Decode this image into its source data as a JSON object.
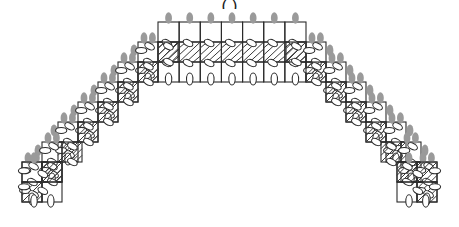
{
  "figure": {
    "title_fragment": "( )",
    "type": "stepped-masonry-arch-diagram",
    "background_color": "#ffffff",
    "line_color": "#2b2b2b",
    "hatch_color": "#3a3a3a",
    "joint_fill": "#ffffff",
    "load_marker_color": "#9a9a9a",
    "symmetry": "bilateral-vertical",
    "canvas": {
      "width": 459,
      "height": 227
    }
  },
  "geometry": {
    "cell_size": 20,
    "crown": {
      "left_x": 158,
      "right_x": 306,
      "top_y": 22,
      "rows": 3,
      "columns": 7,
      "row_tops": [
        22,
        42,
        62
      ],
      "soffit_y": 82
    },
    "steps_per_side": 7,
    "step_dx": 20,
    "step_dy": 20,
    "left_springing": {
      "x": 22,
      "y": 162,
      "width": 40,
      "height": 40
    },
    "right_springing": {
      "x": 397,
      "y": 162,
      "width": 40,
      "height": 40
    }
  },
  "elements": {
    "block_label": "masonry-block",
    "hatched_block_label": "hatched-block",
    "joint_label": "joint-marker",
    "load_marker_label": "load-marker",
    "crown_label": "arch-crown",
    "left_haunch_label": "left-haunch",
    "right_haunch_label": "right-haunch"
  },
  "chart_data": {
    "type": "diagram",
    "title": "",
    "crown_columns": 7,
    "crown_rows": 3,
    "steps_per_side": 7,
    "total_load_markers_top": 7,
    "load_markers_per_side": 14,
    "step_profile_left": [
      {
        "step": 1,
        "x": 138,
        "y": 42
      },
      {
        "step": 2,
        "x": 118,
        "y": 62
      },
      {
        "step": 3,
        "x": 98,
        "y": 82
      },
      {
        "step": 4,
        "x": 78,
        "y": 102
      },
      {
        "step": 5,
        "x": 58,
        "y": 122
      },
      {
        "step": 6,
        "x": 42,
        "y": 142
      },
      {
        "step": 7,
        "x": 22,
        "y": 162
      }
    ],
    "step_profile_right": [
      {
        "step": 1,
        "x": 306,
        "y": 42
      },
      {
        "step": 2,
        "x": 326,
        "y": 62
      },
      {
        "step": 3,
        "x": 346,
        "y": 82
      },
      {
        "step": 4,
        "x": 366,
        "y": 102
      },
      {
        "step": 5,
        "x": 386,
        "y": 122
      },
      {
        "step": 6,
        "x": 401,
        "y": 142
      },
      {
        "step": 7,
        "x": 417,
        "y": 162
      }
    ]
  }
}
